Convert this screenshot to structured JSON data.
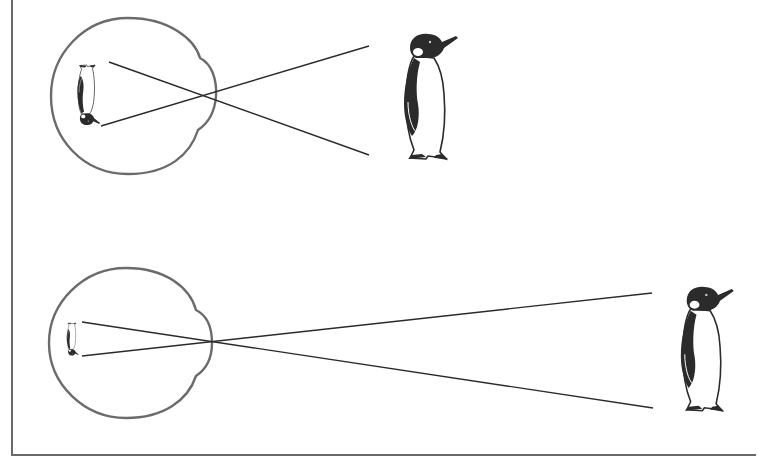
{
  "diagram": {
    "title": "Eye forming inverted retinal image of a penguin at near and far distances",
    "colors": {
      "line": "#2a2a2a",
      "eye_outline": "#6b6b6b",
      "frame": "#6a6a6a",
      "penguin_dark": "#2b2b2b",
      "background": "#ffffff"
    },
    "panels": [
      {
        "id": "near",
        "label": "Near object: larger inverted retinal image",
        "eye": {
          "cx": 131,
          "cy": 96,
          "r": 79
        },
        "object": {
          "x": 385,
          "y": 32,
          "height": 132
        },
        "retinal_image": {
          "x": 73,
          "y": 62,
          "height": 64,
          "inverted": true
        },
        "rays": [
          {
            "x1": 109,
            "y1": 62,
            "x2": 369,
            "y2": 155
          },
          {
            "x1": 101,
            "y1": 126,
            "x2": 369,
            "y2": 46
          }
        ]
      },
      {
        "id": "far",
        "label": "Far object: smaller inverted retinal image",
        "eye": {
          "cx": 129,
          "cy": 343,
          "r": 77
        },
        "object": {
          "x": 668,
          "y": 285,
          "height": 130
        },
        "retinal_image": {
          "x": 64,
          "y": 322,
          "height": 34,
          "inverted": true
        },
        "rays": [
          {
            "x1": 82,
            "y1": 322,
            "x2": 653,
            "y2": 408
          },
          {
            "x1": 82,
            "y1": 356,
            "x2": 652,
            "y2": 293
          }
        ]
      }
    ]
  }
}
